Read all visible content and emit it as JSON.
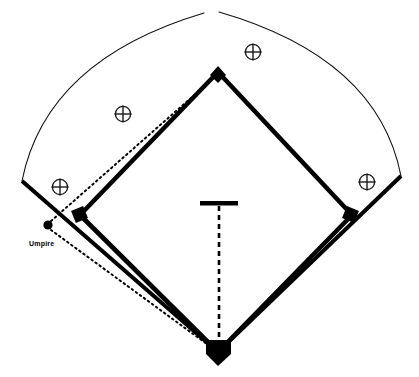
{
  "diagram": {
    "type": "baseball-field-schematic",
    "background_color": "#ffffff",
    "line_color": "#000000",
    "width": 419,
    "height": 377
  },
  "labels": {
    "umpire": "Umpire"
  },
  "outfield_fence": {
    "name": "outfield-arc",
    "stroke_color": "#111111",
    "stroke_width": 1,
    "left_corner": [
      22,
      181
    ],
    "apex": [
      211,
      12
    ],
    "right_corner": [
      401,
      176
    ],
    "gap_at_top": true
  },
  "foul_lines": {
    "stroke_color": "#000000",
    "stroke_width": 4,
    "left_line": [
      [
        22,
        181
      ],
      [
        218,
        352
      ]
    ],
    "right_line": [
      [
        401,
        176
      ],
      [
        218,
        352
      ]
    ]
  },
  "infield_diamond": {
    "name": "infield-diamond",
    "stroke_color": "#000000",
    "stroke_width": 4.5,
    "home_plate": [
      218,
      352
    ],
    "first_base": [
      352,
      215
    ],
    "second_base": [
      218,
      72
    ],
    "third_base": [
      80,
      215
    ]
  },
  "bases": [
    {
      "name": "home-plate",
      "shape": "pentagon",
      "x": 218,
      "y": 352,
      "size": 13,
      "fill": "#000000"
    },
    {
      "name": "first-base",
      "shape": "square",
      "x": 351,
      "y": 215,
      "size": 9,
      "rotation": 20,
      "fill": "#000000"
    },
    {
      "name": "second-base",
      "shape": "diamond",
      "x": 218,
      "y": 74,
      "size": 9,
      "fill": "#000000"
    },
    {
      "name": "third-base",
      "shape": "square",
      "x": 80,
      "y": 215,
      "size": 9,
      "rotation": -20,
      "fill": "#000000"
    }
  ],
  "pitchers_mound": {
    "name": "pitchers-rubber",
    "bar_left_x": 200,
    "bar_right_x": 238,
    "bar_y": 203,
    "bar_thickness": 4,
    "fill": "#000000"
  },
  "pitch_line": {
    "name": "pitch-dashed-line",
    "from": [
      219,
      205
    ],
    "to": [
      219,
      348
    ],
    "style": "dashed",
    "dash_pattern": "5 4",
    "stroke_width": 2.5,
    "stroke_color": "#000000"
  },
  "umpire": {
    "name": "umpire-marker",
    "x": 48,
    "y": 225,
    "radius": 4.5,
    "fill": "#000000",
    "label_x": 30,
    "label_y": 244,
    "sight_lines": [
      {
        "name": "umpire-to-second-base",
        "from": [
          50,
          222
        ],
        "to": [
          216,
          76
        ]
      },
      {
        "name": "umpire-to-home-plate",
        "from": [
          50,
          230
        ],
        "to": [
          216,
          350
        ]
      }
    ],
    "line_style": "dotted",
    "dash_pattern": "1.6 3.2",
    "stroke_width": 2
  },
  "fielder_positions": [
    {
      "name": "fielder-marker-center",
      "x": 253,
      "y": 52,
      "radius": 8
    },
    {
      "name": "fielder-marker-left-center",
      "x": 123,
      "y": 114,
      "radius": 8
    },
    {
      "name": "fielder-marker-left",
      "x": 60,
      "y": 187,
      "radius": 8
    },
    {
      "name": "fielder-marker-right",
      "x": 367,
      "y": 182,
      "radius": 8
    }
  ]
}
